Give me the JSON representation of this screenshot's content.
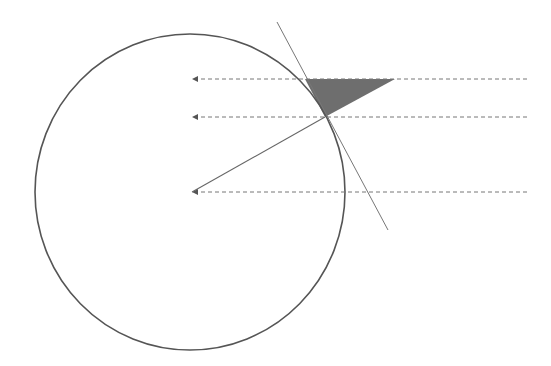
{
  "diagram": {
    "colors": {
      "stroke": "#555555",
      "dashed": "#777777",
      "fill": "#6e6e6e",
      "background": "#ffffff"
    },
    "circle": {
      "cx": 190,
      "cy": 192,
      "rx": 155,
      "ry": 158
    },
    "rays": [
      {
        "y": 79,
        "x1": 527,
        "x2": 192
      },
      {
        "y": 117,
        "x1": 527,
        "x2": 192
      },
      {
        "y": 192,
        "x1": 527,
        "x2": 192
      }
    ],
    "tangent_line": {
      "x1": 277,
      "y1": 22,
      "x2": 388,
      "y2": 230
    },
    "radius_line": {
      "x1": 192,
      "y1": 192,
      "x2": 325,
      "y2": 117
    },
    "shaded_triangle": {
      "points": "305,79 395,79 325,117"
    }
  }
}
